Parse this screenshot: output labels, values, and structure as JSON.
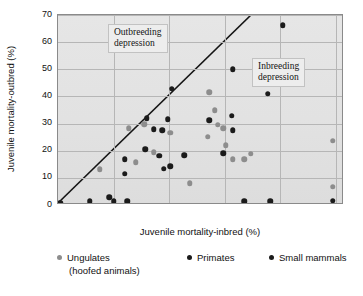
{
  "chart_data": {
    "type": "scatter",
    "title": "",
    "xlabel": "Juvenile mortality-inbred (%)",
    "ylabel": "Juvenile mortality-outbred (%)",
    "xlim": [
      0,
      103
    ],
    "ylim": [
      0,
      70
    ],
    "xticks": [
      20,
      40,
      60,
      80,
      100
    ],
    "yticks": [
      0,
      10,
      20,
      30,
      40,
      50,
      60,
      70
    ],
    "grid": true,
    "legend_position": "bottom",
    "reference_line": {
      "label": "y = x",
      "from": [
        0,
        0
      ],
      "to": [
        70,
        70
      ],
      "color": "#141414"
    },
    "annotations": [
      {
        "name": "outbreeding-depression",
        "line1": "Outbreeding",
        "line2": "depression",
        "x": 25,
        "y": 58
      },
      {
        "name": "inbreeding-depression",
        "line1": "Inbreeding",
        "line2": "depression",
        "x": 80,
        "y": 47
      }
    ],
    "series": [
      {
        "name": "Ungulates",
        "name_line2": "(hoofed animals)",
        "color": "#8d8d8d",
        "marker": "circle",
        "points": [
          [
            15.0,
            13.2
          ],
          [
            25.5,
            28.2
          ],
          [
            28.0,
            15.8
          ],
          [
            31.0,
            29.8
          ],
          [
            34.5,
            19.5
          ],
          [
            40.5,
            26.7
          ],
          [
            47.5,
            8.0
          ],
          [
            54.0,
            25.2
          ],
          [
            54.5,
            41.5
          ],
          [
            56.5,
            35.0
          ],
          [
            57.5,
            29.5
          ],
          [
            59.5,
            28.3
          ],
          [
            60.5,
            22.0
          ],
          [
            63.0,
            16.9
          ],
          [
            67.0,
            16.8
          ],
          [
            69.5,
            18.8
          ],
          [
            99.0,
            23.7
          ],
          [
            99.0,
            6.8
          ]
        ]
      },
      {
        "name": "Primates",
        "color": "#1b1b1b",
        "marker": "circle",
        "points": [
          [
            24.0,
            16.8
          ],
          [
            24.0,
            11.6
          ],
          [
            31.5,
            20.5
          ],
          [
            32.0,
            31.9
          ],
          [
            34.5,
            28.0
          ],
          [
            36.5,
            18.2
          ],
          [
            37.5,
            27.5
          ],
          [
            38.0,
            13.3
          ],
          [
            39.5,
            31.6
          ],
          [
            40.5,
            14.2
          ],
          [
            41.0,
            42.9
          ],
          [
            45.5,
            18.3
          ],
          [
            54.5,
            31.2
          ],
          [
            59.5,
            19.0
          ],
          [
            62.5,
            32.8
          ],
          [
            63.0,
            27.5
          ],
          [
            63.0,
            50.0
          ],
          [
            75.5,
            40.9
          ],
          [
            81.0,
            66.2
          ]
        ]
      },
      {
        "name": "Small mammals",
        "color": "#1b1b1b",
        "marker": "circle",
        "points": [
          [
            0.8,
            0.8
          ],
          [
            11.5,
            1.4
          ],
          [
            18.5,
            2.8
          ],
          [
            20.0,
            1.4
          ],
          [
            25.0,
            1.4
          ],
          [
            67.0,
            1.4
          ],
          [
            76.5,
            1.4
          ],
          [
            99.0,
            1.5
          ]
        ]
      }
    ]
  }
}
